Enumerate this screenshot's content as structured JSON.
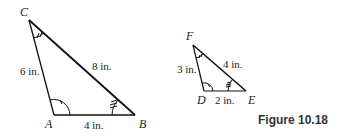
{
  "figure": {
    "caption": "Figure 10.18",
    "triangle_large": {
      "vertices": {
        "A": "A",
        "B": "B",
        "C": "C"
      },
      "sides": {
        "CA": "6 in.",
        "CB": "8 in.",
        "AB": "4 in."
      }
    },
    "triangle_small": {
      "vertices": {
        "D": "D",
        "E": "E",
        "F": "F"
      },
      "sides": {
        "FD": "3 in.",
        "FE": "4 in.",
        "DE": "2 in."
      }
    }
  }
}
